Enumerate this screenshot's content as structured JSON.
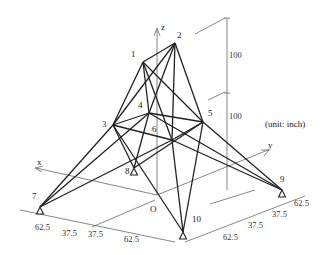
{
  "diagram": {
    "type": "space truss (25-bar transmission tower)",
    "unit_label": "(unit: inch)",
    "axes": {
      "x": "x",
      "y": "y",
      "z": "z",
      "origin": "O"
    },
    "nodes": [
      {
        "id": "1",
        "x": 143,
        "y": 62,
        "lx": 131,
        "ly": 57
      },
      {
        "id": "2",
        "x": 175,
        "y": 43,
        "lx": 177,
        "ly": 38
      },
      {
        "id": "3",
        "x": 113,
        "y": 125,
        "lx": 102,
        "ly": 127
      },
      {
        "id": "4",
        "x": 149,
        "y": 113,
        "lx": 138,
        "ly": 108
      },
      {
        "id": "5",
        "x": 203,
        "y": 122,
        "lx": 208,
        "ly": 116
      },
      {
        "id": "6",
        "x": 172,
        "y": 140,
        "lx": 152,
        "ly": 132
      },
      {
        "id": "7",
        "x": 40,
        "y": 207,
        "lx": 32,
        "ly": 199
      },
      {
        "id": "8",
        "x": 134,
        "y": 168,
        "lx": 125,
        "ly": 174
      },
      {
        "id": "9",
        "x": 282,
        "y": 190,
        "lx": 280,
        "ly": 182
      },
      {
        "id": "10",
        "x": 183,
        "y": 232,
        "lx": 192,
        "ly": 222
      }
    ],
    "members": [
      [
        "1",
        "2"
      ],
      [
        "1",
        "4"
      ],
      [
        "2",
        "3"
      ],
      [
        "1",
        "5"
      ],
      [
        "2",
        "6"
      ],
      [
        "2",
        "4"
      ],
      [
        "2",
        "5"
      ],
      [
        "1",
        "3"
      ],
      [
        "1",
        "6"
      ],
      [
        "3",
        "6"
      ],
      [
        "4",
        "5"
      ],
      [
        "3",
        "4"
      ],
      [
        "5",
        "6"
      ],
      [
        "3",
        "10"
      ],
      [
        "6",
        "7"
      ],
      [
        "4",
        "9"
      ],
      [
        "5",
        "8"
      ],
      [
        "4",
        "7"
      ],
      [
        "3",
        "8"
      ],
      [
        "5",
        "10"
      ],
      [
        "6",
        "9"
      ],
      [
        "6",
        "10"
      ],
      [
        "3",
        "7"
      ],
      [
        "4",
        "8"
      ],
      [
        "5",
        "9"
      ]
    ],
    "supports": [
      "7",
      "8",
      "9",
      "10"
    ],
    "dimensions": {
      "vertical": [
        "100",
        "100"
      ],
      "x_direction": [
        "62.5",
        "37.5",
        "37.5",
        "62.5"
      ],
      "y_direction": [
        "62.5",
        "37.5",
        "37.5",
        "62.5"
      ]
    }
  }
}
